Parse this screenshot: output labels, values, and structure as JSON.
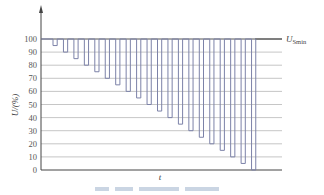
{
  "chart_data": {
    "type": "line",
    "subtype": "step-waveform",
    "title": "",
    "xlabel": "t",
    "ylabel": "U/(%)",
    "ylim": [
      0,
      100
    ],
    "yticks": [
      0,
      10,
      20,
      30,
      40,
      50,
      60,
      70,
      80,
      90,
      100
    ],
    "grid": {
      "horizontal": true,
      "vertical": false
    },
    "reference_line": {
      "label": "U_Smin",
      "value": 100
    },
    "series": [
      {
        "name": "voltage dips",
        "baseline": 100,
        "dip_levels": [
          95,
          90,
          85,
          80,
          75,
          70,
          65,
          60,
          55,
          50,
          45,
          40,
          35,
          30,
          25,
          20,
          15,
          10,
          5,
          0
        ]
      }
    ],
    "colors": {
      "waveform": "#7c82a8",
      "grid": "#b8b8b8",
      "axis": "#444444"
    }
  },
  "labels": {
    "y_axis": "U/(%)",
    "x_axis": "t",
    "ref_main": "U",
    "ref_sub": "Smin"
  }
}
